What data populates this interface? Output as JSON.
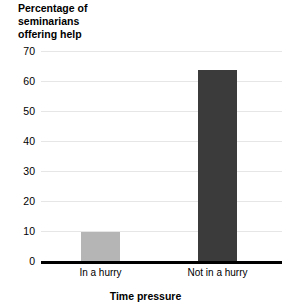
{
  "chart_data": {
    "type": "bar",
    "title": "",
    "ylabel": "Percentage of\nseminarians\noffering help",
    "xlabel": "Time pressure",
    "categories": [
      "In a hurry",
      "Not in a hurry"
    ],
    "values": [
      10,
      64
    ],
    "ylim": [
      0,
      70
    ],
    "yticks": [
      0,
      10,
      20,
      30,
      40,
      50,
      60,
      70
    ],
    "ytick_labels": [
      "0",
      "10",
      "20",
      "30",
      "40",
      "50",
      "60",
      "70"
    ],
    "grid": true,
    "legend": "none",
    "bar_colors": [
      "#b5b5b5",
      "#3b3b3b"
    ],
    "axis_color": "#000000",
    "gridline_color": "#e6e6e6",
    "background": "#ffffff"
  }
}
